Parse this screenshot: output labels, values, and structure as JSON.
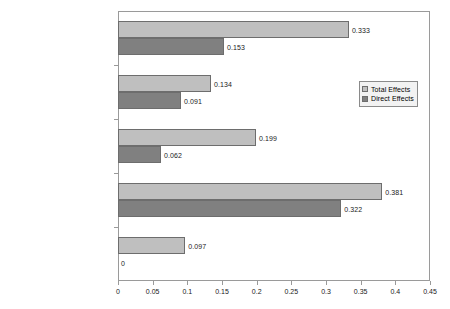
{
  "chart_data": {
    "type": "bar",
    "orientation": "horizontal",
    "title": "",
    "xlabel": "",
    "ylabel": "",
    "xlim": [
      0,
      0.45
    ],
    "xticks": [
      "0",
      "0.05",
      "0.1",
      "0.15",
      "0.2",
      "0.25",
      "0.3",
      "0.35",
      "0.4",
      "0.45"
    ],
    "xtick_values": [
      0,
      0.05,
      0.1,
      0.15,
      0.2,
      0.25,
      0.3,
      0.35,
      0.4,
      0.45
    ],
    "grid": false,
    "legend_position": "center-right",
    "categories": [
      "Total Issue Effects",
      "Issue Priority for Perot Issue",
      "Relative Issue Proximity",
      "Relative Candidate Evaluation",
      "Evaluations of the Economy"
    ],
    "series": [
      {
        "name": "Total Effects",
        "color": "#bfbfbf",
        "values": [
          0.333,
          0.134,
          0.199,
          0.381,
          0.097
        ],
        "labels": [
          "0.333",
          "0.134",
          "0.199",
          "0.381",
          "0.097"
        ]
      },
      {
        "name": "Direct Effects",
        "color": "#808080",
        "values": [
          0.153,
          0.091,
          0.062,
          0.322,
          0
        ],
        "labels": [
          "0.153",
          "0.091",
          "0.062",
          "0.322",
          "0"
        ]
      }
    ]
  },
  "legend": {
    "entries": [
      {
        "label": "Total Effects"
      },
      {
        "label": "Direct Effects"
      }
    ]
  }
}
